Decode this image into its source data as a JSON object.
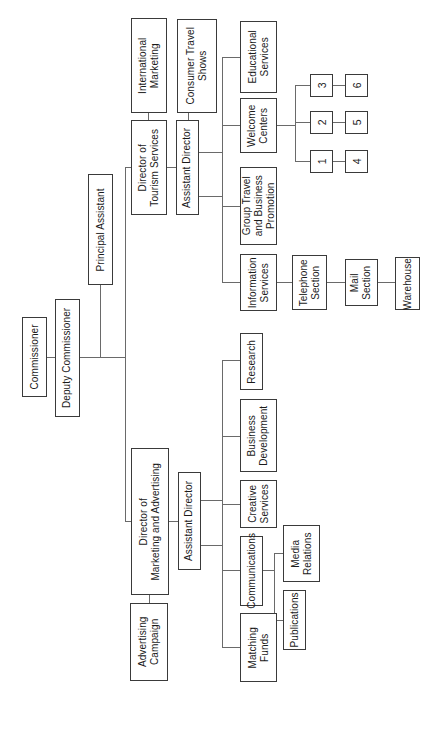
{
  "diagram": {
    "type": "organizational-chart",
    "orientation": "rotated-90-counterclockwise",
    "nodes": {
      "commissioner": "Commissioner",
      "deputy_commissioner": "Deputy Commissioner",
      "principal_assistant": "Principal Assistant",
      "director_tourism": "Director of\nTourism Services",
      "international_marketing": "International\nMarketing",
      "assistant_director_tourism": "Assistant Director",
      "consumer_travel_shows": "Consumer Travel\nShows",
      "educational_services": "Educational\nServices",
      "welcome_centers": "Welcome\nCenters",
      "group_travel": "Group Travel\nand Business\nPromotion",
      "information_services": "Information\nServices",
      "telephone_section": "Telephone\nSection",
      "mail_section": "Mail\nSection",
      "warehouse": "Warehouse",
      "wc1": "1",
      "wc2": "2",
      "wc3": "3",
      "wc4": "4",
      "wc5": "5",
      "wc6": "6",
      "director_marketing": "Director of\nMarketing and Advertising",
      "advertising_campaign": "Advertising\nCampaign",
      "assistant_director_marketing": "Assistant Director",
      "research": "Research",
      "business_development": "Business\nDevelopment",
      "creative_services": "Creative\nServices",
      "communications": "Communications",
      "media_relations": "Media\nRelations",
      "publications": "Publications",
      "matching_funds": "Matching\nFunds"
    },
    "colors": {
      "box_border": "#3a3a3a",
      "box_fill": "#ffffff",
      "connector": "#6a6a6a",
      "text": "#1a1a1a",
      "background": "#ffffff"
    }
  }
}
